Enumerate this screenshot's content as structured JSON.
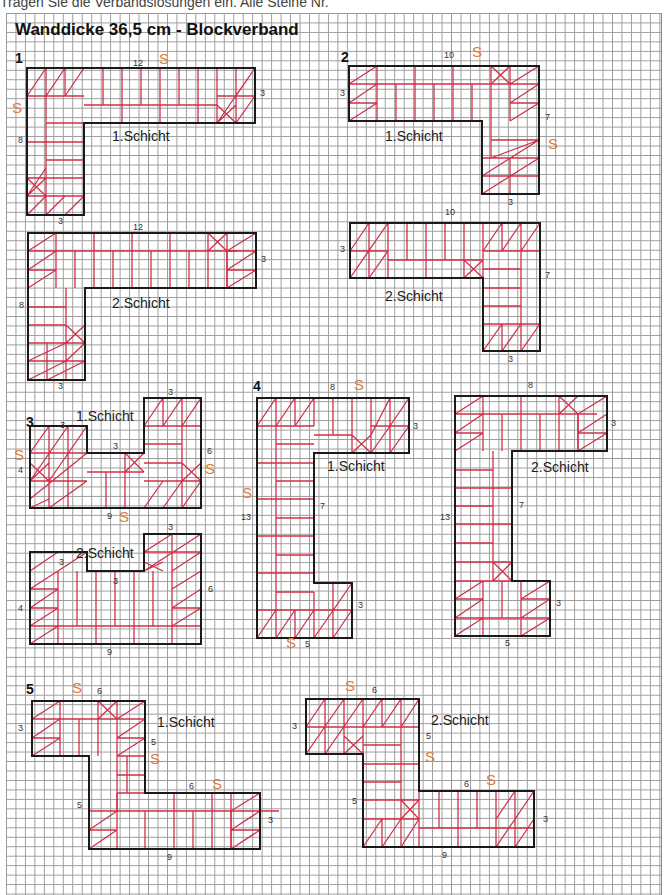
{
  "header": {
    "instruction": "Tragen Sie die Verbandslösungen ein. Alle Steine Nr.",
    "title": "Wanddicke 36,5 cm - Blockverband"
  },
  "colors": {
    "outline": "#1a1a1a",
    "brick": "#d0304a",
    "s_marker": "#e07a3a",
    "grid": "#9a9a9a"
  },
  "tasks": [
    {
      "number": "1",
      "layers": [
        {
          "label": "1.Schicht",
          "dims": [
            "12",
            "3",
            "8",
            "3"
          ],
          "s_markers": 2
        },
        {
          "label": "2.Schicht",
          "dims": [
            "12",
            "3",
            "8",
            "3"
          ],
          "s_markers": 0
        }
      ]
    },
    {
      "number": "2",
      "layers": [
        {
          "label": "1.Schicht",
          "dims": [
            "10",
            "3",
            "7",
            "3"
          ],
          "s_markers": 2
        },
        {
          "label": "2.Schicht",
          "dims": [
            "10",
            "3",
            "7",
            "3"
          ],
          "s_markers": 0
        }
      ]
    },
    {
      "number": "3",
      "layers": [
        {
          "label": "1.Schicht",
          "dims": [
            "3",
            "3",
            "3",
            "4",
            "6",
            "9"
          ],
          "s_markers": 3
        },
        {
          "label": "2.Schicht",
          "dims": [
            "3",
            "3",
            "3",
            "4",
            "6",
            "9"
          ],
          "s_markers": 0
        }
      ]
    },
    {
      "number": "4",
      "layers": [
        {
          "label": "1.Schicht",
          "dims": [
            "8",
            "3",
            "7",
            "13",
            "3",
            "5"
          ],
          "s_markers": 3
        },
        {
          "label": "2.Schicht",
          "dims": [
            "8",
            "3",
            "7",
            "13",
            "3",
            "5"
          ],
          "s_markers": 0
        }
      ]
    },
    {
      "number": "5",
      "layers": [
        {
          "label": "1.Schicht",
          "dims": [
            "6",
            "3",
            "5",
            "5",
            "6",
            "3",
            "9"
          ],
          "s_markers": 3
        },
        {
          "label": "2.Schicht",
          "dims": [
            "6",
            "3",
            "5",
            "5",
            "6",
            "3",
            "9"
          ],
          "s_markers": 3
        }
      ]
    }
  ],
  "s_marker_text": "S"
}
